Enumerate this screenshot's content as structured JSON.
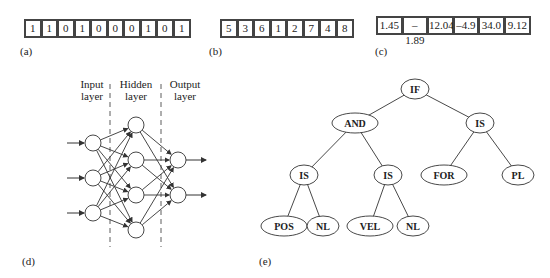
{
  "panels": {
    "a": {
      "label": "(a)",
      "values": [
        "1",
        "1",
        "0",
        "1",
        "0",
        "0",
        "0",
        "1",
        "0",
        "1"
      ]
    },
    "b": {
      "label": "(b)",
      "values": [
        "5",
        "3",
        "6",
        "1",
        "2",
        "7",
        "4",
        "8"
      ]
    },
    "c": {
      "label": "(c)",
      "values": [
        "1.45",
        "–1.89",
        "12.04",
        "–4.9",
        "34.0",
        "9.12"
      ]
    },
    "d": {
      "label": "(d)",
      "layers": [
        {
          "name": "Input",
          "sub": "layer",
          "neurons": 3
        },
        {
          "name": "Hidden",
          "sub": "layer",
          "neurons": 4
        },
        {
          "name": "Output",
          "sub": "layer",
          "neurons": 2
        }
      ]
    },
    "e": {
      "label": "(e)",
      "nodes": {
        "root": "IF",
        "and": "AND",
        "is_right": "IS",
        "is_left": "IS",
        "is_mid": "IS",
        "for": "FOR",
        "pl": "PL",
        "pos": "POS",
        "nl1": "NL",
        "vel": "VEL",
        "nl2": "NL"
      }
    }
  },
  "colors": {
    "stroke": "#333333",
    "text": "#222222",
    "background": "#ffffff"
  }
}
